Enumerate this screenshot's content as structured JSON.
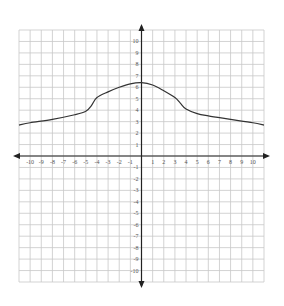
{
  "chart_data": {
    "type": "line",
    "title": "",
    "xlabel": "",
    "ylabel": "",
    "xlim": [
      -11,
      11
    ],
    "ylim": [
      -11,
      11
    ],
    "grid": true,
    "x_ticks": [
      -10,
      -9,
      -8,
      -7,
      -6,
      -5,
      -4,
      -3,
      -2,
      -1,
      1,
      2,
      3,
      4,
      5,
      6,
      7,
      8,
      9,
      10
    ],
    "y_ticks": [
      -10,
      -9,
      -8,
      -7,
      -6,
      -5,
      -4,
      -3,
      -2,
      -1,
      1,
      2,
      3,
      4,
      5,
      6,
      7,
      8,
      9,
      10
    ],
    "x_tick_labels": [
      "-10",
      "-9",
      "-8",
      "-7",
      "-6",
      "-5",
      "-4",
      "-3",
      "-2",
      "-1",
      "1",
      "2",
      "3",
      "4",
      "5",
      "6",
      "7",
      "8",
      "9",
      "10"
    ],
    "y_tick_labels": [
      "-10",
      "-9",
      "-8",
      "-7",
      "-6",
      "-5",
      "-4",
      "-3",
      "-2",
      "-1",
      "1",
      "2",
      "3",
      "4",
      "5",
      "6",
      "7",
      "8",
      "9",
      "10"
    ],
    "series": [
      {
        "name": "f(x)",
        "x": [
          -11,
          -10,
          -8,
          -6,
          -5,
          -4.5,
          -4,
          -3,
          -2,
          -1,
          0,
          1,
          2,
          3,
          3.5,
          4,
          5,
          6,
          8,
          10,
          11
        ],
        "y": [
          2.7,
          2.9,
          3.2,
          3.6,
          3.9,
          4.4,
          5.1,
          5.6,
          6.0,
          6.3,
          6.4,
          6.2,
          5.7,
          5.1,
          4.6,
          4.1,
          3.7,
          3.5,
          3.2,
          2.9,
          2.7
        ]
      }
    ],
    "axes_arrows": true
  },
  "colors": {
    "grid": "#c8c8c8",
    "axis": "#222222",
    "curve": "#333333",
    "label": "#555555"
  }
}
